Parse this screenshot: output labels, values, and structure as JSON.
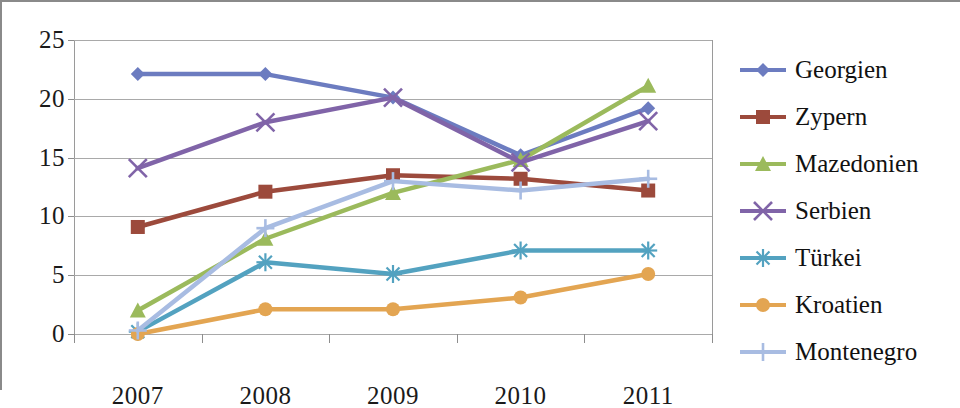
{
  "chart_data": {
    "type": "line",
    "title": "",
    "subtitle": "",
    "xlabel": "",
    "ylabel": "",
    "categories": [
      "2007",
      "2008",
      "2009",
      "2010",
      "2011"
    ],
    "x": [
      2007,
      2008,
      2009,
      2010,
      2011
    ],
    "ylim": [
      0,
      25
    ],
    "yticks": [
      0,
      5,
      10,
      15,
      20,
      25
    ],
    "ytick_labels": [
      "0",
      "5",
      "10",
      "15",
      "20",
      "25"
    ],
    "grid": true,
    "legend_position": "right",
    "series": [
      {
        "name": "Georgien",
        "color": "#6c7cc0",
        "marker": "diamond",
        "values": [
          22.1,
          22.1,
          20.1,
          15.2,
          19.2
        ]
      },
      {
        "name": "Zypern",
        "color": "#9c4a3c",
        "marker": "square",
        "values": [
          9.1,
          12.1,
          13.5,
          13.2,
          12.2
        ]
      },
      {
        "name": "Mazedonien",
        "color": "#9bba5c",
        "marker": "triangle",
        "values": [
          2.0,
          8.1,
          12.0,
          14.8,
          21.1
        ]
      },
      {
        "name": "Serbien",
        "color": "#8064a8",
        "marker": "x",
        "values": [
          14.1,
          18.0,
          20.1,
          14.6,
          18.1
        ]
      },
      {
        "name": "Türkei",
        "color": "#53a2c0",
        "marker": "asterisk",
        "values": [
          0.2,
          6.1,
          5.1,
          7.1,
          7.1
        ]
      },
      {
        "name": "Kroatien",
        "color": "#e8a martillo",
        "marker": "circle",
        "values": [
          0.0,
          2.1,
          2.1,
          3.1,
          5.1
        ]
      },
      {
        "name": "Montenegro",
        "color": "#a8bce2",
        "marker": "plus",
        "values": [
          0.3,
          9.0,
          13.0,
          12.2,
          13.2
        ]
      }
    ]
  },
  "axis": {
    "y_labels": [
      "25",
      "20",
      "15",
      "10",
      "5",
      "0"
    ],
    "x_labels": [
      "2007",
      "2008",
      "2009",
      "2010",
      "2011"
    ]
  },
  "legend": {
    "items": [
      {
        "label": "Georgien",
        "color": "#6c7cc0",
        "marker": "diamond"
      },
      {
        "label": "Zypern",
        "color": "#9c4a3c",
        "marker": "square"
      },
      {
        "label": "Mazedonien",
        "color": "#9bba5c",
        "marker": "triangle"
      },
      {
        "label": "Serbien",
        "color": "#8064a8",
        "marker": "x"
      },
      {
        "label": "Türkei",
        "color": "#53a2c0",
        "marker": "asterisk"
      },
      {
        "label": "Kroatien",
        "color": "#e0a council",
        "marker": "circle"
      },
      {
        "label": "Montenegro",
        "color": "#a8bce2",
        "marker": "plus"
      }
    ]
  },
  "colors": {
    "georgien": "#6c7cc0",
    "zypern": "#9c4a3c",
    "mazedonien": "#9bba5c",
    "serbien": "#8064a8",
    "tuerkei": "#53a2c0",
    "kroatien": "#e3a552",
    "montenegro": "#a8bce2",
    "gridline": "#a9a9a9",
    "axis_text": "#1a1a1a"
  }
}
